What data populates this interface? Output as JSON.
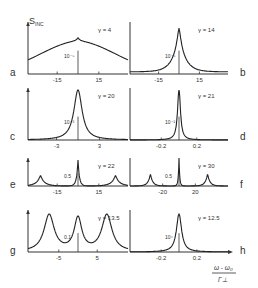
{
  "figure": {
    "y_axis_label": "S",
    "y_axis_subscript": "INC",
    "x_axis_label_numerator": "ω - ω₀",
    "x_axis_label_denominator": "Γ⊥"
  },
  "chart_data": [
    {
      "panel": "a",
      "type": "line",
      "gamma_label": "γ = 4",
      "xticks": [
        "-15",
        "15"
      ],
      "xtick_values": [
        -15,
        15
      ],
      "xlim": [
        -36,
        36
      ],
      "scale_bar_label": "10⁻⁵",
      "shape": "broad peak with small cusp at center",
      "params": {
        "peaks": [
          [
            0,
            1.0,
            22,
            "exp"
          ]
        ],
        "cusp": 0.08
      }
    },
    {
      "panel": "b",
      "type": "line",
      "gamma_label": "γ = 14",
      "xticks": [
        "-15",
        "15"
      ],
      "xtick_values": [
        -15,
        15
      ],
      "xlim": [
        -36,
        36
      ],
      "scale_bar_label": "10⁻⁵",
      "shape": "sharp central cusp on broad wings",
      "params": {
        "peaks": [
          [
            0,
            1.0,
            5,
            "cusp"
          ]
        ],
        "base": 0.05
      }
    },
    {
      "panel": "c",
      "type": "line",
      "gamma_label": "γ = 20",
      "xticks": [
        "-3",
        "3"
      ],
      "xtick_values": [
        -3,
        3
      ],
      "xlim": [
        -7,
        7
      ],
      "scale_bar_label": "10⁻³",
      "shape": "single narrow Lorentzian-like peak",
      "params": {
        "peaks": [
          [
            0,
            1.0,
            0.7,
            "lor"
          ]
        ]
      }
    },
    {
      "panel": "d",
      "type": "line",
      "gamma_label": "γ = 21",
      "xticks": [
        "-0.2",
        "0.2"
      ],
      "xtick_values": [
        -0.2,
        0.2
      ],
      "xlim": [
        -0.55,
        0.55
      ],
      "scale_bar_label": "10⁻²",
      "shape": "very narrow central peak",
      "params": {
        "peaks": [
          [
            0,
            1.0,
            0.02,
            "lor"
          ]
        ]
      }
    },
    {
      "panel": "e",
      "type": "line",
      "gamma_label": "γ = 22",
      "xticks": [
        "-15",
        "15"
      ],
      "xtick_values": [
        -15,
        15
      ],
      "xlim": [
        -36,
        36
      ],
      "scale_bar_label": "0.5",
      "shape": "central peak with two side peaks",
      "params": {
        "peaks": [
          [
            0,
            1.0,
            1.2,
            "cusp"
          ],
          [
            -27,
            0.4,
            3.5,
            "cusp"
          ],
          [
            27,
            0.4,
            3.5,
            "cusp"
          ]
        ]
      }
    },
    {
      "panel": "f",
      "type": "line",
      "gamma_label": "γ = 30",
      "xticks": [
        "-20",
        "20"
      ],
      "xtick_values": [
        -20,
        20
      ],
      "xlim": [
        -60,
        60
      ],
      "scale_bar_label": "0.5",
      "shape": "tall narrow central peak with two side peaks",
      "params": {
        "peaks": [
          [
            0,
            1.0,
            1.0,
            "cusp"
          ],
          [
            -35,
            0.42,
            3.5,
            "cusp"
          ],
          [
            35,
            0.42,
            3.5,
            "cusp"
          ]
        ]
      }
    },
    {
      "panel": "g",
      "type": "line",
      "gamma_label": "γ = 13.5",
      "xticks": [
        "-5",
        "5"
      ],
      "xtick_values": [
        -5,
        5
      ],
      "xlim": [
        -13,
        13
      ],
      "scale_bar_label": "0.1",
      "shape": "three comparable peaks (triplet)",
      "params": {
        "peaks": [
          [
            -7.5,
            0.95,
            1.6,
            "lor"
          ],
          [
            0,
            0.85,
            1.2,
            "lor"
          ],
          [
            7.5,
            0.95,
            1.6,
            "lor"
          ]
        ]
      }
    },
    {
      "panel": "h",
      "type": "line",
      "gamma_label": "γ = 12.5",
      "xticks": [
        "-0.2",
        "0.2"
      ],
      "xtick_values": [
        -0.2,
        0.2
      ],
      "xlim": [
        -0.55,
        0.55
      ],
      "scale_bar_label": "10⁴",
      "shape": "narrow central peak",
      "params": {
        "peaks": [
          [
            0,
            1.0,
            0.035,
            "lor"
          ]
        ]
      }
    }
  ]
}
